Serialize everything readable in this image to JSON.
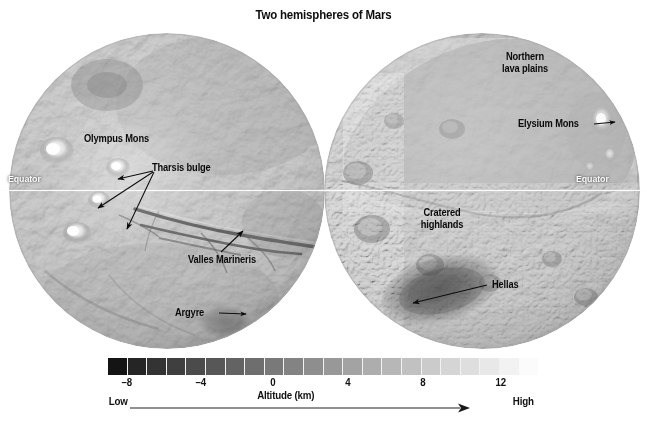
{
  "figure": {
    "title": "Two hemispheres of Mars"
  },
  "hemispheres": [
    {
      "id": "west",
      "name": "western-hemisphere",
      "equator_label": "Equator",
      "labels": [
        {
          "name": "olympus-mons",
          "text": "Olympus Mons"
        },
        {
          "name": "tharsis-bulge",
          "text": "Tharsis bulge"
        },
        {
          "name": "valles-marineris",
          "text": "Valles Marineris"
        },
        {
          "name": "argyre",
          "text": "Argyre"
        }
      ]
    },
    {
      "id": "east",
      "name": "eastern-hemisphere",
      "equator_label": "Equator",
      "labels": [
        {
          "name": "northern-lava-plains",
          "line1": "Northern",
          "line2": "lava plains"
        },
        {
          "name": "elysium-mons",
          "text": "Elysium Mons"
        },
        {
          "name": "cratered-highlands",
          "line1": "Cratered",
          "line2": "highlands"
        },
        {
          "name": "hellas",
          "text": "Hellas"
        }
      ]
    }
  ],
  "chart_data": {
    "type": "heatmap",
    "title": "Two hemispheres of Mars",
    "colorbar": {
      "label": "Altitude (km)",
      "ticks": [
        -8,
        -4,
        0,
        4,
        8,
        12
      ],
      "tick_labels": [
        "–8",
        "–4",
        "0",
        "4",
        "8",
        "12"
      ],
      "range": [
        -9,
        14
      ],
      "low_label": "Low",
      "high_label": "High",
      "orientation": "horizontal",
      "segments": 22,
      "colormap": "grayscale",
      "color_low": "#141414",
      "color_high": "#fbfbfb",
      "arrow_direction": "right"
    },
    "features": [
      {
        "label": "Olympus Mons",
        "hemisphere": "west",
        "kind": "volcano",
        "altitude_km": 14
      },
      {
        "label": "Tharsis bulge",
        "hemisphere": "west",
        "kind": "volcanic-rise",
        "altitude_km": 8
      },
      {
        "label": "Valles Marineris",
        "hemisphere": "west",
        "kind": "canyon-system",
        "altitude_km": -4
      },
      {
        "label": "Argyre",
        "hemisphere": "west",
        "kind": "impact-basin",
        "altitude_km": -4
      },
      {
        "label": "Northern lava plains",
        "hemisphere": "east",
        "kind": "lowland-plains",
        "altitude_km": -4
      },
      {
        "label": "Elysium Mons",
        "hemisphere": "east",
        "kind": "volcano",
        "altitude_km": 12
      },
      {
        "label": "Cratered highlands",
        "hemisphere": "east",
        "kind": "highlands",
        "altitude_km": 4
      },
      {
        "label": "Hellas",
        "hemisphere": "east",
        "kind": "impact-basin",
        "altitude_km": -8
      }
    ],
    "equator_line": {
      "label": "Equator",
      "color": "#ffffff"
    }
  },
  "colorbar_ui": {
    "axis_title": "Altitude (km)",
    "ticks": [
      "–8",
      "–4",
      "0",
      "4",
      "8",
      "12"
    ],
    "low_label": "Low",
    "high_label": "High"
  }
}
